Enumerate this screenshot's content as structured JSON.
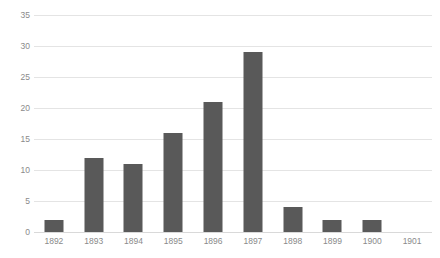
{
  "chart_data": {
    "type": "bar",
    "title": "",
    "subtitle": "",
    "xlabel": "",
    "ylabel": "",
    "categories": [
      "1892",
      "1893",
      "1894",
      "1895",
      "1896",
      "1897",
      "1898",
      "1899",
      "1900",
      "1901"
    ],
    "values": [
      2,
      12,
      11,
      16,
      21,
      29,
      4,
      2,
      2,
      0
    ],
    "ylim": [
      0,
      35
    ],
    "y_ticks": [
      0,
      5,
      10,
      15,
      20,
      25,
      30,
      35
    ],
    "y_tick_labels": [
      "0",
      "5",
      "10",
      "15",
      "20",
      "25",
      "30",
      "35"
    ],
    "grid": true,
    "grid_axis": "y",
    "legend": false,
    "legend_position": "none",
    "bar_color": "#595959",
    "gridline_color": "#E4E4E4",
    "axis_label_color": "#8A8A8A",
    "background_color": "#FFFFFF"
  }
}
